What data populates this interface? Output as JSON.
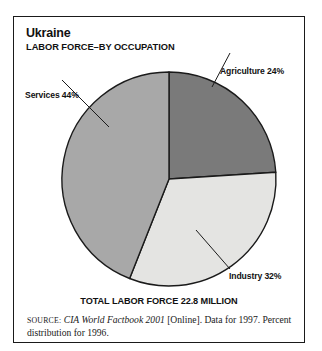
{
  "figure": {
    "title": "Ukraine",
    "subtitle": "LABOR FORCE–BY OCCUPATION",
    "total_caption": "TOTAL LABOR FORCE 22.8 MILLION"
  },
  "labels": {
    "agriculture": "Agriculture 24%",
    "services": "Services 44%",
    "industry": "Industry 32%"
  },
  "source": {
    "label": "SOURCE:",
    "work": "CIA World Factbook 2001",
    "rest": " [Online]. Data for 1997. Percent distribution for 1996."
  },
  "colors": {
    "agriculture": "#7a7a7a",
    "services": "#a8a8a8",
    "industry": "#e4e4e2",
    "outline": "#1a1a1a",
    "frame": "#1a1a1a",
    "text": "#111111"
  },
  "chart_data": {
    "type": "pie",
    "subtitle": "LABOR FORCE–BY OCCUPATION",
    "categories": [
      "Agriculture",
      "Industry",
      "Services"
    ],
    "values": [
      24,
      32,
      44
    ],
    "unit": "percent",
    "total_label": "TOTAL LABOR FORCE 22.8 MILLION",
    "total_value": 22.8,
    "total_unit": "million",
    "slice_colors": [
      "#7a7a7a",
      "#e4e4e2",
      "#a8a8a8"
    ],
    "start_angle_deg": 0,
    "direction": "clockwise",
    "legend": "none",
    "labels_position": "outside-with-leader-lines",
    "annotations": [
      "Agriculture 24%",
      "Industry 32%",
      "Services 44%"
    ],
    "grid": false
  }
}
